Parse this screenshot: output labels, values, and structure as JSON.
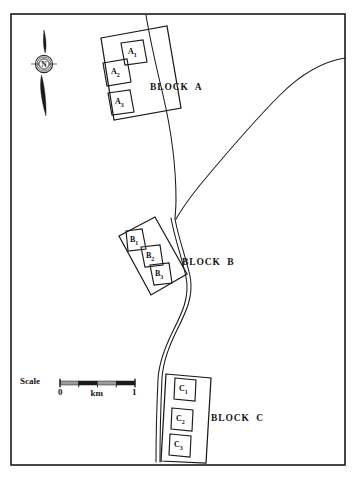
{
  "map": {
    "title": "Block layout map",
    "frame": {
      "x": 11,
      "y": 14,
      "w": 334,
      "h": 451,
      "stroke": "#1a1a1a"
    },
    "background": "#ffffff",
    "ink": "#1a1a1a"
  },
  "compass": {
    "name": "north-arrow",
    "letter": "N",
    "center_x": 44,
    "center_y": 64
  },
  "rivers": [
    {
      "name": "main-river",
      "path": "M 146,15 C 150,40 157,70 163,95 C 170,125 176,165 176,200 C 176,210 175,215 175,219"
    },
    {
      "name": "tributary-river",
      "path": "M 345,58 C 320,62 300,75 280,95 C 255,120 225,155 200,185 C 188,200 180,212 176,219"
    },
    {
      "name": "lower-river",
      "path": "M 175,219 C 179,240 186,258 190,276 C 194,296 186,312 177,330 C 168,348 163,362 162,378 C 161,400 160,430 160,462"
    },
    {
      "name": "river-bank-accent",
      "path": "M 171,218 C 175,240 182,258 186,277 C 190,297 182,313 173,331 C 164,349 159,363 158,379 C 157,401 156,431 156,462"
    }
  ],
  "blocks": [
    {
      "id": "block-a",
      "label": "BLOCK  A",
      "label_x": 150,
      "label_y": 82,
      "outline": "M 101,38 L 167,26 L 181,108 L 114,120 Z",
      "plots": [
        {
          "id": "a1",
          "label": "A",
          "sub": "1",
          "outline": "M 121,43 L 143,40 L 147,62 L 125,65 Z",
          "cx": 134,
          "cy": 52
        },
        {
          "id": "a2",
          "label": "A",
          "sub": "2",
          "outline": "M 103,63 L 127,59 L 131,82 L 107,86 Z",
          "cx": 117,
          "cy": 72
        },
        {
          "id": "a3",
          "label": "A",
          "sub": "3",
          "outline": "M 108,93 L 130,90 L 134,112 L 112,115 Z",
          "cx": 121,
          "cy": 102
        }
      ]
    },
    {
      "id": "block-b",
      "label": "BLOCK  B",
      "label_x": 182,
      "label_y": 257,
      "outline": "M 119,236 L 155,217 L 187,274 L 151,295 Z",
      "plots": [
        {
          "id": "b1",
          "label": "B",
          "sub": "1",
          "outline": "M 126,231 L 142,229 L 146,249 L 128,251 Z",
          "cx": 136,
          "cy": 240
        },
        {
          "id": "b2",
          "label": "B",
          "sub": "2",
          "outline": "M 141,247 L 160,245 L 163,265 L 145,267 Z",
          "cx": 152,
          "cy": 256
        },
        {
          "id": "b3",
          "label": "B",
          "sub": "3",
          "outline": "M 150,265 L 169,263 L 172,283 L 154,285 Z",
          "cx": 161,
          "cy": 274
        }
      ]
    },
    {
      "id": "block-c",
      "label": "BLOCK  C",
      "label_x": 211,
      "label_y": 413,
      "outline": "M 166,374 L 211,378 L 206,463 L 161,461 Z",
      "plots": [
        {
          "id": "c1",
          "label": "C",
          "sub": "1",
          "outline": "M 175,378 L 196,380 L 195,401 L 174,399 Z",
          "cx": 185,
          "cy": 389
        },
        {
          "id": "c2",
          "label": "C",
          "sub": "2",
          "outline": "M 172,408 L 193,410 L 192,431 L 171,429 Z",
          "cx": 182,
          "cy": 419
        },
        {
          "id": "c3",
          "label": "C",
          "sub": "3",
          "outline": "M 170,434 L 191,436 L 190,457 L 169,455 Z",
          "cx": 180,
          "cy": 445
        }
      ]
    }
  ],
  "scale": {
    "name": "scale-bar",
    "word": "Scale",
    "unit": "km",
    "min_label": "0",
    "max_label": "1",
    "bar_x": 60,
    "bar_y": 381,
    "bar_w": 75,
    "bar_h": 4,
    "segments": 4,
    "light_color": "#9a9a9a",
    "dark_color": "#1a1a1a"
  }
}
